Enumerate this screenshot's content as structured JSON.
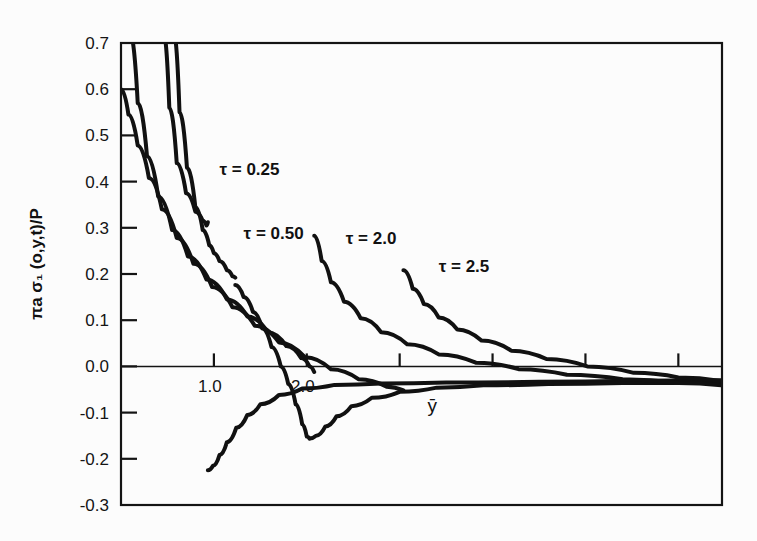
{
  "chart_data": {
    "type": "line",
    "title": "",
    "xlabel": "ȳ",
    "ylabel": "πa σ₁ (o,y,t)/P",
    "xlim": [
      0,
      6.47
    ],
    "ylim": [
      -0.3,
      0.7
    ],
    "grid": false,
    "legend_position": "inline-annotations",
    "x_ticks": [
      {
        "value": 1.0,
        "label": "1.0"
      },
      {
        "value": 2.0,
        "label": "2.0"
      },
      {
        "value": 3.0,
        "label": ""
      },
      {
        "value": 4.0,
        "label": ""
      },
      {
        "value": 5.0,
        "label": ""
      },
      {
        "value": 6.0,
        "label": ""
      }
    ],
    "y_ticks": [
      {
        "value": 0.7,
        "label": "0.7"
      },
      {
        "value": 0.6,
        "label": "0.6"
      },
      {
        "value": 0.5,
        "label": "0.5"
      },
      {
        "value": 0.4,
        "label": "0.4"
      },
      {
        "value": 0.3,
        "label": "0.3"
      },
      {
        "value": 0.2,
        "label": "0.2"
      },
      {
        "value": 0.1,
        "label": "0.1"
      },
      {
        "value": 0.0,
        "label": "0.0"
      },
      {
        "value": -0.1,
        "label": "-0.1"
      },
      {
        "value": -0.2,
        "label": "-0.2"
      },
      {
        "value": -0.3,
        "label": "-0.3"
      }
    ],
    "series": [
      {
        "name": "τ = 0.25",
        "label": "τ = 0.25",
        "label_x": 1.06,
        "label_y": 0.415,
        "color": "#111111",
        "segments": [
          [
            [
              0.46,
              0.72
            ],
            [
              0.52,
              0.56
            ],
            [
              0.6,
              0.44
            ],
            [
              0.7,
              0.375
            ],
            [
              0.8,
              0.335
            ],
            [
              0.88,
              0.315
            ],
            [
              0.92,
              0.305
            ],
            [
              0.935,
              0.312
            ]
          ],
          [
            [
              0.935,
              -0.225
            ],
            [
              0.99,
              -0.215
            ],
            [
              1.06,
              -0.192
            ],
            [
              1.14,
              -0.164
            ],
            [
              1.24,
              -0.133
            ],
            [
              1.36,
              -0.105
            ],
            [
              1.5,
              -0.082
            ],
            [
              1.7,
              -0.062
            ],
            [
              1.95,
              -0.048
            ],
            [
              2.3,
              -0.04
            ],
            [
              2.8,
              -0.037
            ],
            [
              3.5,
              -0.035
            ],
            [
              4.5,
              -0.033
            ],
            [
              5.5,
              -0.031
            ],
            [
              6.47,
              -0.03
            ]
          ]
        ]
      },
      {
        "name": "τ = 0.50",
        "label": "τ = 0.50",
        "label_x": 1.32,
        "label_y": 0.275,
        "color": "#111111",
        "segments": [
          [
            [
              0.57,
              0.72
            ],
            [
              0.63,
              0.55
            ],
            [
              0.71,
              0.43
            ],
            [
              0.8,
              0.345
            ],
            [
              0.88,
              0.295
            ],
            [
              0.95,
              0.262
            ],
            [
              1.0,
              0.245
            ],
            [
              1.06,
              0.228
            ],
            [
              1.14,
              0.208
            ],
            [
              1.2,
              0.195
            ],
            [
              1.23,
              0.192
            ]
          ],
          [
            [
              1.23,
              0.176
            ],
            [
              1.32,
              0.15
            ],
            [
              1.42,
              0.118
            ],
            [
              1.52,
              0.082
            ],
            [
              1.62,
              0.042
            ],
            [
              1.72,
              0.0
            ],
            [
              1.8,
              -0.038
            ],
            [
              1.88,
              -0.082
            ],
            [
              1.95,
              -0.125
            ],
            [
              2.0,
              -0.152
            ],
            [
              2.03,
              -0.156
            ]
          ],
          [
            [
              2.03,
              -0.156
            ],
            [
              2.1,
              -0.15
            ],
            [
              2.2,
              -0.13
            ],
            [
              2.32,
              -0.108
            ],
            [
              2.48,
              -0.086
            ],
            [
              2.7,
              -0.068
            ],
            [
              3.0,
              -0.055
            ],
            [
              3.4,
              -0.046
            ],
            [
              3.9,
              -0.041
            ],
            [
              4.6,
              -0.038
            ],
            [
              5.4,
              -0.036
            ],
            [
              6.47,
              -0.034
            ]
          ]
        ]
      },
      {
        "name": "τ = 2.0",
        "label": "τ = 2.0",
        "label_x": 2.42,
        "label_y": 0.265,
        "color": "#111111",
        "segments": [
          [
            [
              0.1,
              0.72
            ],
            [
              0.18,
              0.57
            ],
            [
              0.28,
              0.455
            ],
            [
              0.4,
              0.368
            ],
            [
              0.55,
              0.295
            ],
            [
              0.72,
              0.238
            ],
            [
              0.92,
              0.188
            ],
            [
              1.14,
              0.145
            ],
            [
              1.36,
              0.108
            ],
            [
              1.58,
              0.074
            ],
            [
              1.78,
              0.044
            ],
            [
              1.94,
              0.018
            ],
            [
              2.03,
              0.0
            ],
            [
              2.08,
              -0.012
            ]
          ],
          [
            [
              2.08,
              0.283
            ],
            [
              2.16,
              0.228
            ],
            [
              2.26,
              0.182
            ],
            [
              2.4,
              0.14
            ],
            [
              2.58,
              0.104
            ],
            [
              2.8,
              0.074
            ],
            [
              3.08,
              0.048
            ],
            [
              3.42,
              0.026
            ],
            [
              3.82,
              0.008
            ],
            [
              4.28,
              -0.006
            ],
            [
              4.8,
              -0.018
            ],
            [
              5.4,
              -0.028
            ],
            [
              6.0,
              -0.036
            ],
            [
              6.47,
              -0.041
            ]
          ]
        ]
      },
      {
        "name": "τ = 2.5",
        "label": "τ = 2.5",
        "label_x": 3.42,
        "label_y": 0.205,
        "color": "#111111",
        "segments": [
          [
            [
              0.0,
              0.6
            ],
            [
              0.08,
              0.545
            ],
            [
              0.18,
              0.478
            ],
            [
              0.3,
              0.408
            ],
            [
              0.44,
              0.34
            ],
            [
              0.6,
              0.278
            ],
            [
              0.78,
              0.222
            ],
            [
              0.98,
              0.172
            ],
            [
              1.2,
              0.128
            ],
            [
              1.44,
              0.088
            ],
            [
              1.7,
              0.052
            ],
            [
              1.98,
              0.02
            ],
            [
              2.26,
              -0.006
            ],
            [
              2.56,
              -0.028
            ],
            [
              2.86,
              -0.044
            ],
            [
              3.04,
              -0.052
            ]
          ],
          [
            [
              3.04,
              0.208
            ],
            [
              3.14,
              0.168
            ],
            [
              3.26,
              0.135
            ],
            [
              3.42,
              0.106
            ],
            [
              3.62,
              0.08
            ],
            [
              3.88,
              0.056
            ],
            [
              4.2,
              0.034
            ],
            [
              4.58,
              0.016
            ],
            [
              5.02,
              0.0
            ],
            [
              5.52,
              -0.014
            ],
            [
              6.0,
              -0.024
            ],
            [
              6.47,
              -0.032
            ]
          ]
        ]
      }
    ]
  },
  "axes": {
    "frame_color": "#141414",
    "curve_color": "#111111",
    "background": "#fcfcfc"
  }
}
